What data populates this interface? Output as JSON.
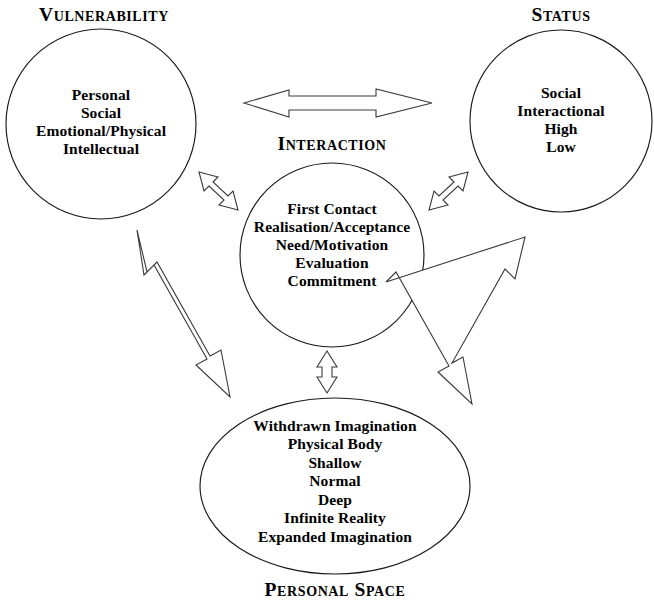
{
  "diagram": {
    "background_color": "#ffffff",
    "stroke_color": "#1a1a1a",
    "nodes": [
      {
        "id": "vulnerability",
        "caption": "Vulnerability",
        "shape": "circle",
        "items": [
          "Personal",
          "Social",
          "Emotional/Physical",
          "Intellectual"
        ],
        "text": "Personal\nSocial\nEmotional/Physical\nIntellectual"
      },
      {
        "id": "status",
        "caption": "Status",
        "shape": "circle",
        "items": [
          "Social",
          "Interactional",
          "High",
          "Low"
        ],
        "text": "Social\nInteractional\nHigh\nLow"
      },
      {
        "id": "interaction",
        "caption": "Interaction",
        "shape": "circle",
        "items": [
          "First Contact",
          "Realisation/Acceptance",
          "Need/Motivation",
          "Evaluation",
          "Commitment"
        ],
        "text": "First Contact\nRealisation/Acceptance\nNeed/Motivation\nEvaluation\nCommitment"
      },
      {
        "id": "personal-space",
        "caption": "Personal Space",
        "shape": "ellipse",
        "items": [
          "Withdrawn Imagination",
          "Physical Body",
          "Shallow",
          "Normal",
          "Deep",
          "Infinite Reality",
          "Expanded Imagination"
        ],
        "text": "Withdrawn Imagination\nPhysical Body\nShallow\nNormal\nDeep\nInfinite Reality\nExpanded Imagination"
      }
    ],
    "connectors": [
      {
        "id": "vulnerability-status",
        "from": "vulnerability",
        "to": "status",
        "style": "double-headed",
        "orientation": "horizontal"
      },
      {
        "id": "vulnerability-interaction",
        "from": "vulnerability",
        "to": "interaction",
        "style": "double-headed",
        "orientation": "diagonal-nw-se"
      },
      {
        "id": "status-interaction",
        "from": "status",
        "to": "interaction",
        "style": "double-headed",
        "orientation": "diagonal-ne-sw"
      },
      {
        "id": "vulnerability-personal-space",
        "from": "vulnerability",
        "to": "personal-space",
        "style": "double-headed",
        "orientation": "diagonal-long-left"
      },
      {
        "id": "status-personal-space",
        "from": "status",
        "to": "personal-space",
        "style": "double-headed",
        "orientation": "diagonal-long-right"
      },
      {
        "id": "interaction-personal-space",
        "from": "interaction",
        "to": "personal-space",
        "style": "double-headed",
        "orientation": "vertical"
      }
    ]
  }
}
